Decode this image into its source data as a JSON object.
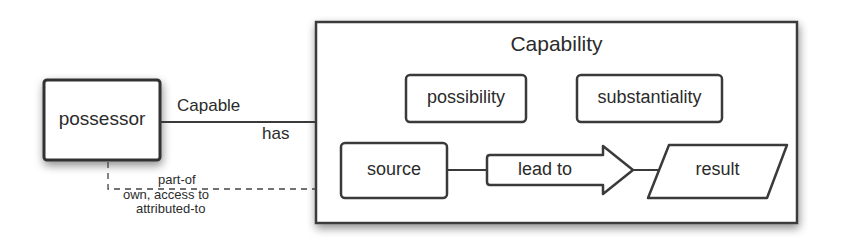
{
  "diagram": {
    "possessor": {
      "label": "possessor"
    },
    "relation": {
      "upper_label": "Capable",
      "lower_label": "has"
    },
    "dashed_relation": {
      "lines": [
        "part-of",
        "own, access to",
        "attributed-to"
      ]
    },
    "capability": {
      "title": "Capability",
      "properties": [
        {
          "label": "possibility"
        },
        {
          "label": "substantiality"
        }
      ],
      "flow": {
        "source": "source",
        "arrow": "lead to",
        "result": "result"
      }
    }
  }
}
